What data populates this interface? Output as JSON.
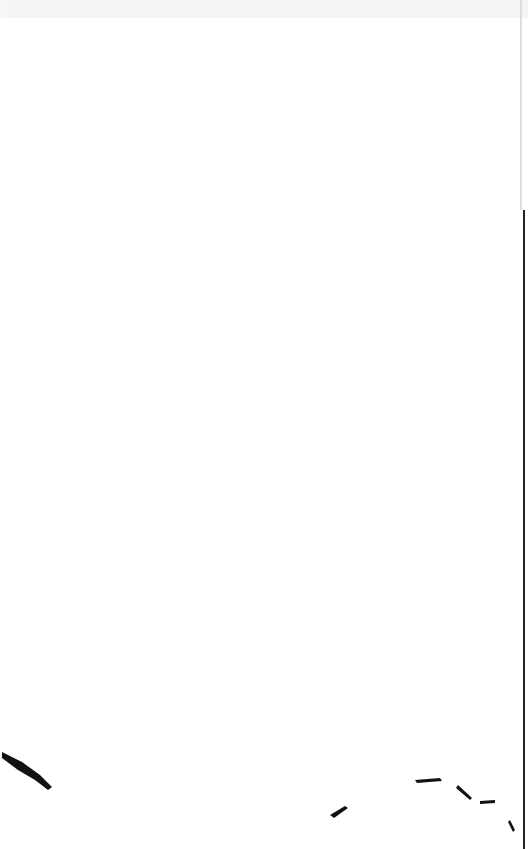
{
  "page": {
    "background_color": "#ffffff",
    "edge_color": "#111111",
    "top_shade_color": "#f3f3f3"
  }
}
